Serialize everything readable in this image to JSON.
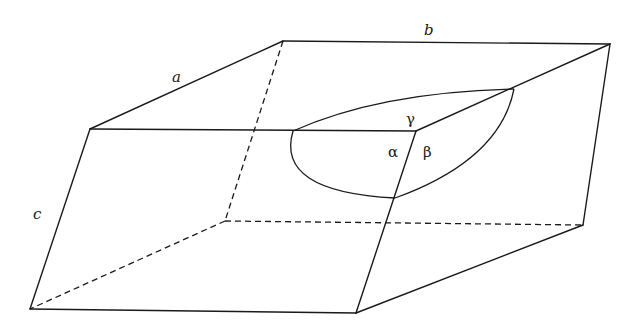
{
  "diagram": {
    "labels": {
      "a": "a",
      "b": "b",
      "c": "c",
      "alpha": "α",
      "beta": "β",
      "gamma": "γ"
    },
    "colors": {
      "line": "#1a1a1a",
      "background": "#ffffff"
    },
    "vertices": {
      "top_back_left": [
        283,
        41
      ],
      "top_back_right": [
        610,
        44
      ],
      "top_front_left": [
        90,
        129
      ],
      "top_front_right": [
        416,
        131
      ],
      "bottom_front_left": [
        30,
        309
      ],
      "bottom_front_right": [
        356,
        313
      ],
      "bottom_back_right": [
        583,
        225
      ],
      "bottom_back_left": [
        225,
        221
      ]
    }
  }
}
